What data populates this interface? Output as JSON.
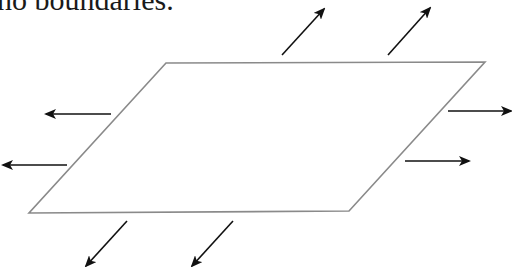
{
  "caption": {
    "text": "no boundaries."
  },
  "figure": {
    "colors": {
      "plane_edge": "#8a8a8a",
      "arrow": "#111111",
      "background": "#ffffff"
    },
    "plane": {
      "points": [
        [
          166,
          63
        ],
        [
          485,
          62
        ],
        [
          349,
          211
        ],
        [
          29,
          213
        ]
      ]
    },
    "arrows": [
      {
        "name": "arrow-up-right-1",
        "from": [
          282,
          55
        ],
        "to": [
          324,
          9
        ]
      },
      {
        "name": "arrow-up-right-2",
        "from": [
          388,
          55
        ],
        "to": [
          430,
          8
        ]
      },
      {
        "name": "arrow-right-1",
        "from": [
          448,
          111
        ],
        "to": [
          511,
          111
        ]
      },
      {
        "name": "arrow-right-2",
        "from": [
          405,
          161
        ],
        "to": [
          469,
          161
        ]
      },
      {
        "name": "arrow-left-1",
        "from": [
          111,
          114
        ],
        "to": [
          46,
          114
        ]
      },
      {
        "name": "arrow-left-2",
        "from": [
          67,
          165
        ],
        "to": [
          3,
          165
        ]
      },
      {
        "name": "arrow-down-left-1",
        "from": [
          127,
          221
        ],
        "to": [
          86,
          266
        ]
      },
      {
        "name": "arrow-down-left-2",
        "from": [
          233,
          221
        ],
        "to": [
          192,
          266
        ]
      }
    ]
  }
}
